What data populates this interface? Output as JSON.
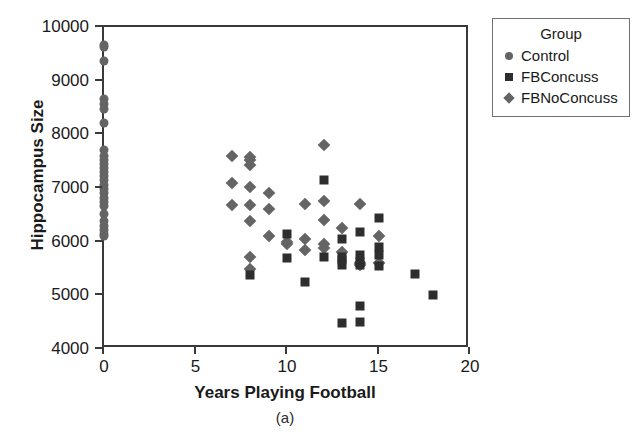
{
  "chart_data": {
    "type": "scatter",
    "title": "",
    "caption": "(a)",
    "xlabel": "Years Playing Football",
    "ylabel": "Hippocampus Size",
    "xlim": [
      0,
      20
    ],
    "ylim": [
      4000,
      10000
    ],
    "xticks": [
      0,
      5,
      10,
      15,
      20
    ],
    "yticks": [
      4000,
      5000,
      6000,
      7000,
      8000,
      9000,
      10000
    ],
    "grid": false,
    "legend": {
      "title": "Group",
      "position": "right-outside",
      "entries": [
        {
          "name": "Control",
          "marker": "circle",
          "color": "#646464"
        },
        {
          "name": "FBConcuss",
          "marker": "square",
          "color": "#2e2e2e"
        },
        {
          "name": "FBNoConcuss",
          "marker": "diamond",
          "color": "#646464"
        }
      ]
    },
    "series": [
      {
        "name": "Control",
        "marker": "circle",
        "color": "#646464",
        "points": [
          [
            0,
            9660
          ],
          [
            0,
            9620
          ],
          [
            0,
            9370
          ],
          [
            0,
            8660
          ],
          [
            0,
            8560
          ],
          [
            0,
            8480
          ],
          [
            0,
            8220
          ],
          [
            0,
            7700
          ],
          [
            0,
            7600
          ],
          [
            0,
            7520
          ],
          [
            0,
            7440
          ],
          [
            0,
            7380
          ],
          [
            0,
            7300
          ],
          [
            0,
            7220
          ],
          [
            0,
            7140
          ],
          [
            0,
            7060
          ],
          [
            0,
            6980
          ],
          [
            0,
            6900
          ],
          [
            0,
            6820
          ],
          [
            0,
            6740
          ],
          [
            0,
            6660
          ],
          [
            0,
            6520
          ],
          [
            0,
            6380
          ],
          [
            0,
            6300
          ],
          [
            0,
            6220
          ],
          [
            0,
            6150
          ],
          [
            0,
            6100
          ]
        ]
      },
      {
        "name": "FBNoConcuss",
        "marker": "diamond",
        "color": "#646464",
        "points": [
          [
            7,
            7600
          ],
          [
            7,
            7100
          ],
          [
            7,
            6680
          ],
          [
            8,
            7580
          ],
          [
            8,
            7520
          ],
          [
            8,
            7420
          ],
          [
            8,
            7020
          ],
          [
            8,
            6680
          ],
          [
            8,
            6380
          ],
          [
            8,
            5720
          ],
          [
            8,
            5500
          ],
          [
            9,
            6900
          ],
          [
            9,
            6600
          ],
          [
            9,
            6100
          ],
          [
            10,
            6000
          ],
          [
            10,
            5950
          ],
          [
            11,
            6700
          ],
          [
            11,
            6050
          ],
          [
            11,
            5850
          ],
          [
            12,
            7800
          ],
          [
            12,
            6750
          ],
          [
            12,
            6400
          ],
          [
            12,
            5950
          ],
          [
            12,
            5880
          ],
          [
            13,
            6250
          ],
          [
            13,
            5800
          ],
          [
            14,
            6700
          ],
          [
            14,
            5600
          ],
          [
            14,
            5560
          ],
          [
            15,
            6100
          ],
          [
            15,
            5600
          ]
        ]
      },
      {
        "name": "FBConcuss",
        "marker": "square",
        "color": "#2e2e2e",
        "points": [
          [
            8,
            5380
          ],
          [
            10,
            6150
          ],
          [
            10,
            5700
          ],
          [
            11,
            5250
          ],
          [
            12,
            7150
          ],
          [
            12,
            5720
          ],
          [
            13,
            6050
          ],
          [
            13,
            5720
          ],
          [
            13,
            5650
          ],
          [
            13,
            5560
          ],
          [
            13,
            4490
          ],
          [
            14,
            6180
          ],
          [
            14,
            5750
          ],
          [
            14,
            5620
          ],
          [
            14,
            5560
          ],
          [
            14,
            4800
          ],
          [
            14,
            4500
          ],
          [
            15,
            6450
          ],
          [
            15,
            5900
          ],
          [
            15,
            5750
          ],
          [
            15,
            5550
          ],
          [
            17,
            5400
          ],
          [
            18,
            5010
          ]
        ]
      }
    ]
  }
}
